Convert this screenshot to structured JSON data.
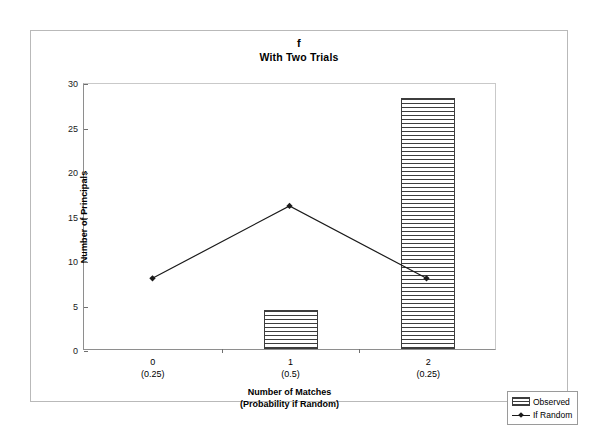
{
  "chart_data": {
    "type": "bar",
    "title": "f",
    "subtitle": "With Two Trials",
    "xlabel_line1": "Number of Matches",
    "xlabel_line2": "(Probability if Random)",
    "ylabel": "Number of Principals",
    "categories": [
      "0",
      "1",
      "2"
    ],
    "category_probabilities": [
      "(0.25)",
      "(0.5)",
      "(0.25)"
    ],
    "ylim": [
      0,
      30
    ],
    "yticks": [
      0,
      5,
      10,
      15,
      20,
      25,
      30
    ],
    "grid": false,
    "legend_position": "bottom-right",
    "series": [
      {
        "name": "Observed",
        "type": "bar",
        "values": [
          0,
          4.4,
          28.2
        ]
      },
      {
        "name": "If Random",
        "type": "line",
        "marker": "diamond",
        "values": [
          8,
          16.2,
          8
        ]
      }
    ],
    "colors": {
      "bar_outline": "#3d3d3d",
      "bar_hatch": "#3d3d3d",
      "line": "#1a1a1a",
      "axis": "#8e8e8e",
      "frame": "#b9b9b9",
      "background": "#ffffff"
    }
  },
  "legend": {
    "items": [
      {
        "label": "Observed",
        "swatch": "hatched-bar-swatch"
      },
      {
        "label": "If Random",
        "swatch": "line-diamond-swatch"
      }
    ]
  }
}
